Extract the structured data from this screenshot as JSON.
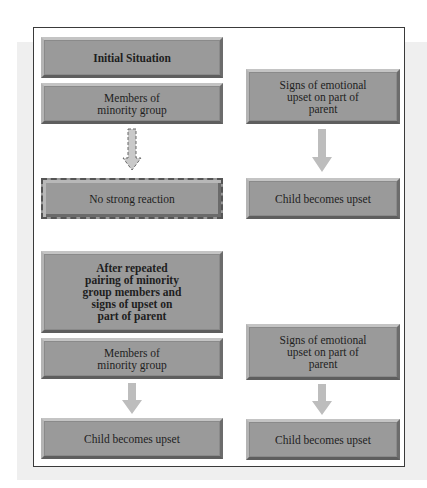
{
  "colors": {
    "box_fill": "#9a9a9a",
    "arrow": "#bdbdbd",
    "frame": "#3a3a3a",
    "background_band": "#efefef"
  },
  "diagram": {
    "initial": {
      "header": "Initial Situation",
      "left_stimulus": "Members of\nminority group",
      "left_response": "No strong reaction",
      "right_stimulus": "Signs of emotional\nupset on part of\nparent",
      "right_response": "Child becomes upset"
    },
    "after": {
      "header": "After repeated\npairing of minority\ngroup members and\nsigns of upset on\npart of parent",
      "left_stimulus": "Members of\nminority group",
      "left_response": "Child becomes upset",
      "right_stimulus": "Signs of emotional\nupset on part of\nparent",
      "right_response": "Child becomes upset"
    },
    "arrows": [
      {
        "id": "initial-left",
        "style": "dashed",
        "meaning": "weak/no link"
      },
      {
        "id": "initial-right",
        "style": "solid"
      },
      {
        "id": "after-left",
        "style": "solid"
      },
      {
        "id": "after-right",
        "style": "solid"
      }
    ]
  }
}
